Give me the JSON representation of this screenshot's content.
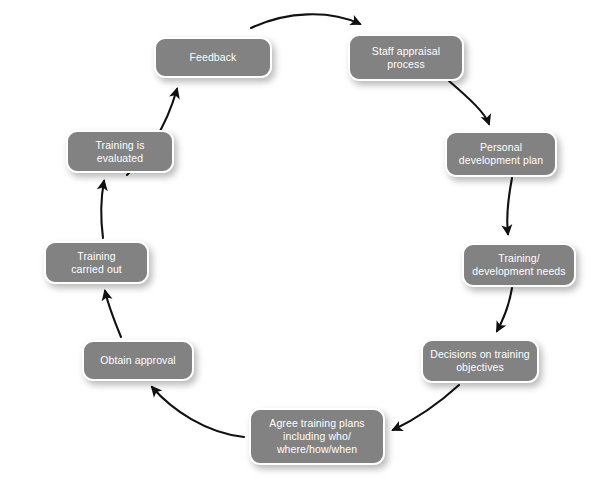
{
  "diagram": {
    "type": "cycle-flow-diagram",
    "background_color": "#ffffff",
    "node_fill_color": "#828282",
    "node_border_color": "#ffffff",
    "node_text_color": "#ffffff",
    "arrow_color": "#111111",
    "nodes": [
      {
        "id": "staff-appraisal-process",
        "label": "Staff appraisal\nprocess",
        "x": 348,
        "y": 34,
        "w": 116,
        "h": 47,
        "font_size": 10.5
      },
      {
        "id": "personal-development-plan",
        "label": "Personal\ndevelopment plan",
        "x": 445,
        "y": 131,
        "w": 112,
        "h": 46,
        "font_size": 10.5
      },
      {
        "id": "training-development-needs",
        "label": "Training/\ndevelopment needs",
        "x": 462,
        "y": 243,
        "w": 114,
        "h": 44,
        "font_size": 10.5
      },
      {
        "id": "decisions-on-training-objectives",
        "label": "Decisions on training\nobjectives",
        "x": 421,
        "y": 339,
        "w": 118,
        "h": 44,
        "font_size": 10.5
      },
      {
        "id": "agree-training-plans",
        "label": "Agree training plans\nincluding who/\nwhere/how/when",
        "x": 249,
        "y": 408,
        "w": 136,
        "h": 57,
        "font_size": 10.5
      },
      {
        "id": "obtain-approval",
        "label": "Obtain approval",
        "x": 82,
        "y": 340,
        "w": 112,
        "h": 41,
        "font_size": 10.5
      },
      {
        "id": "training-carried-out",
        "label": "Training\ncarried out",
        "x": 44,
        "y": 241,
        "w": 105,
        "h": 43,
        "font_size": 10.5
      },
      {
        "id": "training-is-evaluated",
        "label": "Training is\nevaluated",
        "x": 66,
        "y": 130,
        "w": 108,
        "h": 43,
        "font_size": 10.5
      },
      {
        "id": "feedback",
        "label": "Feedback",
        "x": 154,
        "y": 37,
        "w": 118,
        "h": 41,
        "font_size": 10.5
      }
    ],
    "edges": [
      {
        "id": "edge-feedback-to-staff-appraisal",
        "from": "feedback",
        "to": "staff-appraisal-process",
        "path": "M 251 28 C 287 11, 330 10, 360 24"
      },
      {
        "id": "edge-staff-appraisal-to-personal-development-plan",
        "from": "staff-appraisal-process",
        "to": "personal-development-plan",
        "path": "M 449 81 C 470 99, 485 113, 489 124"
      },
      {
        "id": "edge-personal-development-plan-to-training-needs",
        "from": "personal-development-plan",
        "to": "training-development-needs",
        "path": "M 512 178 C 508 199, 506 218, 508 234"
      },
      {
        "id": "edge-training-needs-to-decisions",
        "from": "training-development-needs",
        "to": "decisions-on-training-objectives",
        "path": "M 512 288 C 509 306, 503 320, 497 331"
      },
      {
        "id": "edge-decisions-to-agree-training-plans",
        "from": "decisions-on-training-objectives",
        "to": "agree-training-plans",
        "path": "M 459 385 C 436 406, 412 421, 393 430"
      },
      {
        "id": "edge-agree-training-plans-to-obtain-approval",
        "from": "agree-training-plans",
        "to": "obtain-approval",
        "path": "M 244 437 C 206 433, 172 410, 152 387"
      },
      {
        "id": "edge-obtain-approval-to-training-carried-out",
        "from": "obtain-approval",
        "to": "training-carried-out",
        "path": "M 121 337 C 114 320, 108 304, 105 291"
      },
      {
        "id": "edge-training-carried-out-to-training-evaluated",
        "from": "training-carried-out",
        "to": "training-is-evaluated",
        "path": "M 103 238 C 100 215, 101 197, 104 181"
      },
      {
        "id": "edge-training-evaluated-to-feedback",
        "from": "training-is-evaluated",
        "to": "feedback",
        "path": "M 127 175 C 146 155, 165 131, 177 89"
      }
    ]
  }
}
